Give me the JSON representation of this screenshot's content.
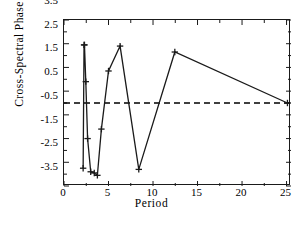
{
  "chart_data": {
    "type": "line",
    "title": "",
    "subtitle": "",
    "xlabel": "Period",
    "ylabel": "Cross-Spectral  Phase",
    "xlim": [
      0,
      25.5
    ],
    "ylim": [
      -3.5,
      3.5
    ],
    "xticks": [
      0,
      5,
      10,
      15,
      20,
      25
    ],
    "yticks": [
      3.5,
      2.5,
      1.5,
      0.5,
      -0.5,
      -1.5,
      -2.5,
      -3.5
    ],
    "xtick_labels": [
      "0",
      "5",
      "10",
      "15",
      "20",
      "25"
    ],
    "ytick_labels": [
      "3.5",
      "2.5",
      "1.5",
      "0.5",
      "-0.5",
      "-1.5",
      "-2.5",
      "-3.5"
    ],
    "minor_ticks": true,
    "grid": false,
    "legend": false,
    "legend_position": "none",
    "marker": "plus",
    "line_color": "#1a1a1a",
    "reference_line": {
      "orientation": "horizontal",
      "value": 0,
      "style": "dashed",
      "color": "#000000"
    },
    "series": [
      {
        "name": "Cross-Spectral Phase",
        "x": [
          2.15,
          2.25,
          2.3,
          2.45,
          2.65,
          3.0,
          3.4,
          3.75,
          4.2,
          5.0,
          6.3,
          8.4,
          12.45,
          25.1
        ],
        "values": [
          -2.75,
          2.45,
          2.45,
          0.9,
          -1.5,
          -2.9,
          -2.95,
          -3.05,
          -1.1,
          1.35,
          2.4,
          -2.8,
          2.15,
          0.0
        ]
      }
    ]
  }
}
